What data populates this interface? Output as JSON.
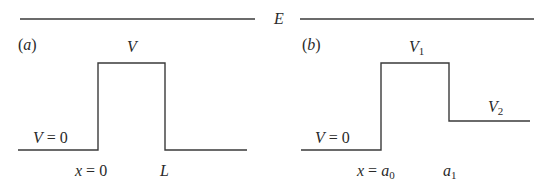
{
  "energy_level": {
    "label": "E"
  },
  "panel_a": {
    "tag": "(a)",
    "barrier_label": "V",
    "outside_label": "V = 0",
    "left_edge_label": "x = 0",
    "right_edge_label": "L"
  },
  "panel_b": {
    "tag": "(b)",
    "barrier_label_main": "V",
    "barrier_label_sub": "1",
    "step_label_main": "V",
    "step_label_sub": "2",
    "outside_label": "V = 0",
    "left_edge_label_main": "x = a",
    "left_edge_label_sub": "0",
    "right_edge_label_main": "a",
    "right_edge_label_sub": "1"
  },
  "colors": {
    "line": "#3a3a3a",
    "text": "#2a2a2a",
    "background": "#ffffff"
  }
}
